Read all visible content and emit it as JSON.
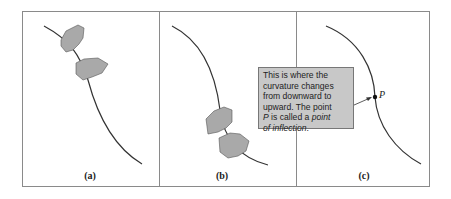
{
  "figure": {
    "panels": [
      {
        "id": "a",
        "label": "(a)",
        "description": "Two hands gripping the curve near the top"
      },
      {
        "id": "b",
        "label": "(b)",
        "description": "Two hands gripping the curve near the bottom"
      },
      {
        "id": "c",
        "label": "(c)",
        "description": "Curve with marked inflection point P"
      }
    ],
    "callout": {
      "line1": "This is where the",
      "line2": "curvature changes",
      "line3": "from downward to",
      "line4": "upward. The point",
      "line5_pre": " is called a ",
      "line5_var": "P",
      "line5_em": "point",
      "line6_em": "of inflection",
      "line6_post": "."
    },
    "point_label": "P",
    "colors": {
      "frame": "#8a8a8a",
      "curve": "#333333",
      "hand_fill": "#a9a9a9",
      "callout_bg": "#c8c8c8"
    }
  }
}
